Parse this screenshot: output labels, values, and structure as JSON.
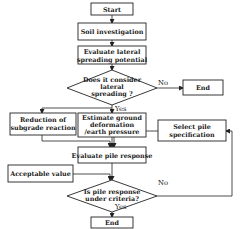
{
  "diagram": {
    "type": "flowchart",
    "nodes": {
      "start": {
        "label": "Start"
      },
      "soil": {
        "label": "Soil investigation"
      },
      "evaluate_lateral": {
        "line1": "Evaluate lateral",
        "line2": "spreading potential"
      },
      "decision_lateral": {
        "line1": "Does it consider",
        "line2": "lateral",
        "line3": "spreading ?"
      },
      "end_top": {
        "label": "End"
      },
      "reduction": {
        "line1": "Reduction of",
        "line2": "subgrade reaction"
      },
      "estimate": {
        "line1": "Estimate ground",
        "line2": "deformation",
        "line3": "/earth pressure"
      },
      "select_pile": {
        "line1": "Select pile",
        "line2": "specification"
      },
      "evaluate_pile": {
        "label": "Evaluate pile response"
      },
      "acceptable": {
        "label": "Acceptable value"
      },
      "decision_pile": {
        "line1": "Is pile response",
        "line2": "under criteria?"
      },
      "end_bottom": {
        "label": "End"
      }
    },
    "edge_labels": {
      "lateral_no": "No",
      "lateral_yes": "Yes",
      "pile_no": "No",
      "pile_yes": "Yes"
    },
    "colors": {
      "stroke": "#222222",
      "background": "#ffffff",
      "text": "#1a1a1a"
    }
  }
}
